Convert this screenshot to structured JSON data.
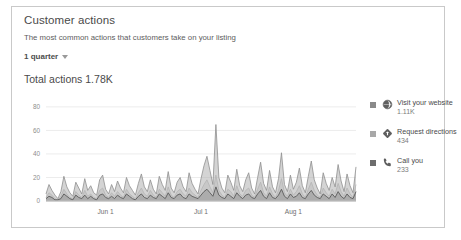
{
  "card": {
    "title": "Customer actions",
    "subtitle": "The most common actions that customers take on your listing",
    "period_label": "1 quarter",
    "period_caret_icon": "chevron-down-icon",
    "total_actions": "Total actions 1.78K"
  },
  "legend": {
    "items": [
      {
        "label": "Visit your website",
        "value": "1.11K",
        "icon": "globe-icon",
        "swatch_color": "#8a8a8a"
      },
      {
        "label": "Request directions",
        "value": "434",
        "icon": "directions-icon",
        "swatch_color": "#a8a8a8"
      },
      {
        "label": "Call you",
        "value": "233",
        "icon": "phone-icon",
        "swatch_color": "#6d6d6d"
      }
    ]
  },
  "chart_data": {
    "type": "area",
    "title": "Customer actions",
    "xlabel": "",
    "ylabel": "",
    "ylim": [
      0,
      85
    ],
    "yticks": [
      0,
      20,
      40,
      60,
      80
    ],
    "ytick_labels": [
      "0",
      "20",
      "40",
      "60",
      "80"
    ],
    "grid": true,
    "legend_position": "right",
    "xtick_labels": [
      "Jun 1",
      "Jul 1",
      "Aug 1"
    ],
    "xtick_positions": [
      20,
      52,
      83
    ],
    "x_count": 105,
    "colors": {
      "visit_your_website": "#b0b0b0",
      "request_directions": "#cfcfcf",
      "call_you": "#6d6d6d",
      "gridline": "#ececec",
      "axis": "#c3c3c3"
    },
    "series": [
      {
        "name": "Visit your website",
        "total": "1.11K",
        "values": [
          6,
          14,
          9,
          5,
          2,
          8,
          21,
          12,
          7,
          4,
          16,
          11,
          6,
          19,
          9,
          13,
          7,
          5,
          18,
          22,
          10,
          6,
          14,
          8,
          17,
          11,
          7,
          20,
          13,
          9,
          5,
          15,
          23,
          12,
          8,
          18,
          10,
          6,
          21,
          14,
          9,
          25,
          11,
          7,
          16,
          20,
          12,
          8,
          24,
          15,
          10,
          6,
          19,
          30,
          38,
          26,
          14,
          65,
          20,
          11,
          7,
          22,
          16,
          9,
          27,
          13,
          8,
          18,
          24,
          11,
          6,
          20,
          33,
          15,
          9,
          26,
          12,
          7,
          19,
          41,
          14,
          8,
          22,
          10,
          16,
          28,
          13,
          7,
          21,
          34,
          18,
          11,
          6,
          24,
          15,
          9,
          20,
          12,
          31,
          17,
          8,
          23,
          13,
          7,
          29
        ]
      },
      {
        "name": "Request directions",
        "total": "434",
        "values": [
          3,
          7,
          5,
          2,
          1,
          4,
          10,
          6,
          3,
          2,
          8,
          5,
          3,
          9,
          4,
          6,
          3,
          2,
          9,
          11,
          5,
          3,
          7,
          4,
          8,
          5,
          3,
          10,
          6,
          4,
          2,
          7,
          11,
          6,
          4,
          9,
          5,
          3,
          10,
          7,
          4,
          12,
          5,
          3,
          8,
          10,
          6,
          4,
          11,
          7,
          5,
          3,
          9,
          14,
          18,
          12,
          7,
          22,
          9,
          5,
          3,
          10,
          8,
          4,
          13,
          6,
          4,
          9,
          11,
          5,
          3,
          10,
          16,
          7,
          4,
          12,
          6,
          3,
          9,
          19,
          7,
          4,
          10,
          5,
          8,
          13,
          6,
          3,
          10,
          16,
          9,
          5,
          3,
          11,
          7,
          4,
          10,
          6,
          15,
          8,
          4,
          11,
          6,
          3,
          14
        ]
      },
      {
        "name": "Call you",
        "total": "233",
        "values": [
          2,
          4,
          3,
          1,
          1,
          2,
          6,
          4,
          2,
          1,
          5,
          3,
          2,
          5,
          2,
          4,
          2,
          1,
          5,
          6,
          3,
          2,
          4,
          2,
          5,
          3,
          2,
          6,
          4,
          2,
          1,
          4,
          6,
          3,
          2,
          5,
          3,
          2,
          6,
          4,
          2,
          7,
          3,
          2,
          5,
          6,
          3,
          2,
          6,
          4,
          3,
          2,
          5,
          8,
          10,
          7,
          4,
          12,
          5,
          3,
          2,
          6,
          4,
          2,
          7,
          4,
          2,
          5,
          6,
          3,
          2,
          6,
          9,
          4,
          2,
          7,
          3,
          2,
          5,
          10,
          4,
          2,
          6,
          3,
          4,
          7,
          3,
          2,
          6,
          9,
          5,
          3,
          2,
          6,
          4,
          2,
          6,
          3,
          8,
          4,
          2,
          6,
          3,
          2,
          8
        ]
      }
    ]
  }
}
